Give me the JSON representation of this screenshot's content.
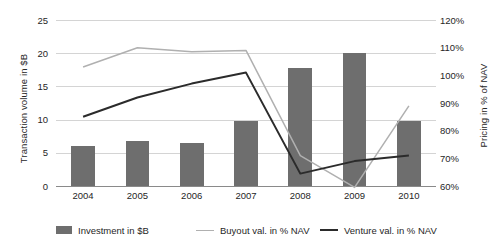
{
  "chart_data": {
    "type": "bar",
    "title": "",
    "subtitle": "",
    "xlabel": "",
    "categories": [
      "2004",
      "2005",
      "2006",
      "2007",
      "2008",
      "2009",
      "2010"
    ],
    "grid": true,
    "legend_position": "bottom",
    "axes": {
      "left": {
        "label": "Transaction volume in $B",
        "ticks": [
          "0",
          "5",
          "10",
          "15",
          "20",
          "25"
        ],
        "tick_values": [
          0,
          5,
          10,
          15,
          20,
          25
        ],
        "min": 0,
        "max": 25
      },
      "right": {
        "label": "Pricing in % of NAV",
        "ticks": [
          "60%",
          "70%",
          "80%",
          "90%",
          "100%",
          "110%",
          "120%"
        ],
        "tick_values": [
          60,
          70,
          80,
          90,
          100,
          110,
          120
        ],
        "min": 60,
        "max": 120
      }
    },
    "series": [
      {
        "name": "Investment in $B",
        "type": "bar",
        "axis": "left",
        "color": "#6e6e6e",
        "values": [
          6.1,
          6.8,
          6.5,
          9.8,
          17.8,
          20.0,
          9.8
        ]
      },
      {
        "name": "Buyout val. in % NAV",
        "type": "line",
        "axis": "right",
        "color": "#b0b0b0",
        "values": [
          103,
          110,
          108.5,
          109,
          71,
          59.5,
          89
        ]
      },
      {
        "name": "Venture val. in % NAV",
        "type": "line",
        "axis": "right",
        "color": "#2b2b2b",
        "values": [
          85,
          92,
          97,
          101,
          64.5,
          69,
          71
        ]
      }
    ]
  }
}
